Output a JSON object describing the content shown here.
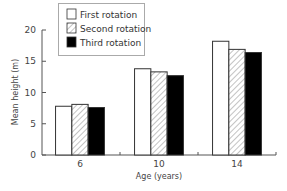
{
  "chart_data": {
    "type": "bar",
    "title": "",
    "xlabel": "Age (years)",
    "ylabel": "Mean height (m)",
    "categories": [
      "6",
      "10",
      "14"
    ],
    "series": [
      {
        "name": "First rotation",
        "values": [
          7.8,
          13.8,
          18.2
        ],
        "fill": "white"
      },
      {
        "name": "Second rotation",
        "values": [
          8.1,
          13.3,
          16.9
        ],
        "fill": "hatched"
      },
      {
        "name": "Third rotation",
        "values": [
          7.6,
          12.7,
          16.4
        ],
        "fill": "black"
      }
    ],
    "ylim": [
      0,
      20
    ],
    "yticks": [
      0,
      5,
      10,
      15,
      20
    ],
    "grid": false,
    "legend_position": "top-left, inside"
  },
  "colors": {
    "axis": "#555555",
    "bar_outline": "#333333",
    "third_fill": "#000000",
    "hatch": "#888888"
  }
}
